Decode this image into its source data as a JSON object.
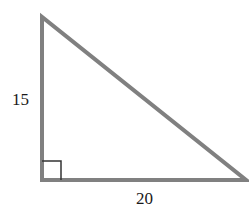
{
  "diagram": {
    "type": "right-triangle",
    "labels": {
      "vertical_leg": "15",
      "horizontal_leg": "20"
    },
    "vertices": {
      "top": [
        42,
        17
      ],
      "right_angle": [
        42,
        180
      ],
      "right": [
        246,
        180
      ]
    },
    "right_angle_marker": {
      "x": 42,
      "y": 161,
      "size": 19
    },
    "colors": {
      "stroke": "#808080",
      "marker": "#333333",
      "text": "#1a1a1a",
      "background": "#ffffff"
    }
  }
}
